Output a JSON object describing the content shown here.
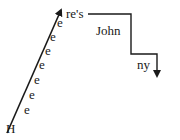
{
  "figure": {
    "start_letter": "H",
    "repeated_letter": "e",
    "repeated_count": 7,
    "top_text": "re's",
    "middle_word": "John",
    "end_text": "ny",
    "color": "#1a1a1a"
  },
  "letters_e": [
    {
      "x": 24,
      "y": 114,
      "text": "e"
    },
    {
      "x": 29,
      "y": 99,
      "text": "e"
    },
    {
      "x": 34,
      "y": 84,
      "text": "e"
    },
    {
      "x": 39,
      "y": 69,
      "text": "e"
    },
    {
      "x": 45,
      "y": 55,
      "text": "e"
    },
    {
      "x": 50,
      "y": 41,
      "text": "e"
    },
    {
      "x": 57,
      "y": 27,
      "text": "e"
    }
  ]
}
